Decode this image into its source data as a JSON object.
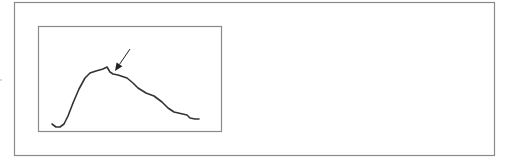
{
  "figure": {
    "colors": {
      "frame": "#8a8a8a",
      "curve": "#333333",
      "arrow": "#222222",
      "background": "#ffffff"
    }
  },
  "outer_frame": {
    "x": 14,
    "y": 2,
    "width": 480,
    "height": 153
  },
  "inner_frame": {
    "x": 38,
    "y": 26,
    "width": 183,
    "height": 105
  },
  "curve": {
    "points": [
      [
        52,
        124
      ],
      [
        56,
        127
      ],
      [
        60,
        127
      ],
      [
        64,
        124
      ],
      [
        68,
        116
      ],
      [
        73,
        103
      ],
      [
        79,
        89
      ],
      [
        85,
        78
      ],
      [
        90,
        73
      ],
      [
        96,
        71
      ],
      [
        103,
        69
      ],
      [
        107,
        67
      ],
      [
        110,
        72
      ],
      [
        113,
        74
      ],
      [
        118,
        75
      ],
      [
        127,
        78
      ],
      [
        133,
        83
      ],
      [
        138,
        88
      ],
      [
        146,
        93
      ],
      [
        154,
        96
      ],
      [
        162,
        102
      ],
      [
        168,
        108
      ],
      [
        174,
        112
      ],
      [
        187,
        115
      ],
      [
        190,
        118
      ],
      [
        195,
        119
      ],
      [
        199,
        119
      ]
    ]
  },
  "arrow": {
    "from": [
      130,
      49
    ],
    "to": [
      115,
      71
    ]
  }
}
